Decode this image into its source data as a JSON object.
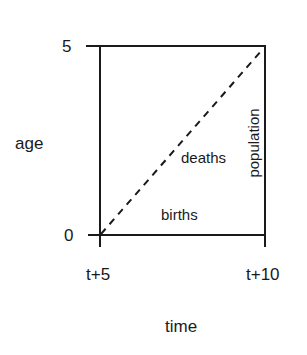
{
  "diagram": {
    "type": "lexis-diagram",
    "axes": {
      "y_label": "age",
      "x_label": "time",
      "y_ticks": [
        "5",
        "0"
      ],
      "x_ticks": [
        "t+5",
        "t+10"
      ]
    },
    "regions": {
      "diagonal_label": "deaths",
      "bottom_label": "births",
      "right_edge_label": "population"
    },
    "style": {
      "line_color": "#1a1a1a",
      "diagonal_style": "dashed",
      "background": "#ffffff"
    }
  }
}
